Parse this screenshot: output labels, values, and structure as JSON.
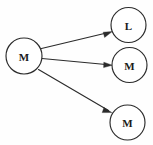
{
  "diagram": {
    "type": "directed-graph",
    "title": "",
    "background_color": "#fefefe",
    "stroke_color": "#2b2b2b",
    "node_fill_color": "#ffffff",
    "nodes": [
      {
        "id": "source",
        "label": "M",
        "cx": 24,
        "cy": 56,
        "r": 18
      },
      {
        "id": "target-top",
        "label": "L",
        "cx": 128.5,
        "cy": 25,
        "r": 17.5
      },
      {
        "id": "target-middle",
        "label": "M",
        "cx": 129.5,
        "cy": 65,
        "r": 17.5
      },
      {
        "id": "target-bottom",
        "label": "M",
        "cx": 127.5,
        "cy": 122.5,
        "r": 17.5
      },
      {
        "id": "overlay-accent",
        "label": "M",
        "cx": 24,
        "cy": 56,
        "r": 18
      }
    ],
    "edges": [
      {
        "id": "edge-source-to-top",
        "from": "source",
        "to": "target-top",
        "from_label": "M",
        "to_label": "L",
        "arrow": "to"
      },
      {
        "id": "edge-source-to-middle",
        "from": "source",
        "to": "target-middle",
        "from_label": "M",
        "to_label": "M",
        "arrow": "to"
      },
      {
        "id": "edge-source-to-bottom",
        "from": "source",
        "to": "target-bottom",
        "from_label": "M",
        "to_label": "M",
        "arrow": "to"
      }
    ]
  }
}
